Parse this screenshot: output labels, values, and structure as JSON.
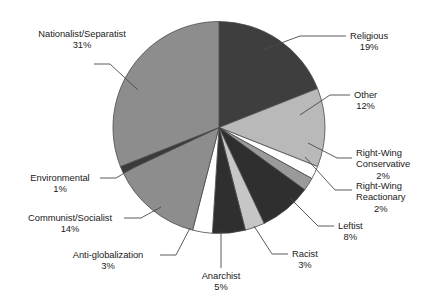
{
  "chart_data": {
    "type": "pie",
    "title": "",
    "subtitle": "",
    "xlabel": "",
    "ylabel": "",
    "legend_position": "none",
    "grid": false,
    "labels_show_percent": true,
    "start_angle_deg": 0,
    "direction": "clockwise",
    "categories": [
      "Religious",
      "Other",
      "Right-Wing Conservative",
      "Right-Wing Reactionary",
      "Leftist",
      "Racist",
      "Anarchist",
      "Anti-globalization",
      "Communist/Socialist",
      "Environmental",
      "Nationalist/Separatist"
    ],
    "values": [
      19,
      12,
      2,
      2,
      8,
      3,
      5,
      3,
      14,
      1,
      31
    ],
    "value_labels": [
      "19%",
      "12%",
      "2%",
      "2%",
      "8%",
      "3%",
      "5%",
      "3%",
      "14%",
      "1%",
      "31%"
    ],
    "colors": [
      "#3e3e3e",
      "#b9b9b9",
      "#ffffff",
      "#9a9a9a",
      "#2f2f2f",
      "#c6c6c6",
      "#2f2f2f",
      "#ffffff",
      "#8d8d8d",
      "#3a3a3a",
      "#8d8d8d"
    ],
    "slice_outline_color": "#4a4a4a",
    "leader_line_color": "#4a4a4a",
    "slices": [
      {
        "name": "Religious",
        "value": 19,
        "label": "Religious",
        "pct": "19%"
      },
      {
        "name": "Other",
        "value": 12,
        "label": "Other",
        "pct": "12%"
      },
      {
        "name": "Right-Wing Conservative",
        "value": 2,
        "label": "Right-Wing Conservative",
        "pct": "2%"
      },
      {
        "name": "Right-Wing Reactionary",
        "value": 2,
        "label": "Right-Wing Reactionary",
        "pct": "2%"
      },
      {
        "name": "Leftist",
        "value": 8,
        "label": "Leftist",
        "pct": "8%"
      },
      {
        "name": "Racist",
        "value": 3,
        "label": "Racist",
        "pct": "3%"
      },
      {
        "name": "Anarchist",
        "value": 5,
        "label": "Anarchist",
        "pct": "5%"
      },
      {
        "name": "Anti-globalization",
        "value": 3,
        "label": "Anti-globalization",
        "pct": "3%"
      },
      {
        "name": "Communist/Socialist",
        "value": 14,
        "label": "Communist/Socialist",
        "pct": "14%"
      },
      {
        "name": "Environmental",
        "value": 1,
        "label": "Environmental",
        "pct": "1%"
      },
      {
        "name": "Nationalist/Separatist",
        "value": 31,
        "label": "Nationalist/Separatist",
        "pct": "31%"
      }
    ]
  },
  "labels": {
    "religious": {
      "name": "Religious",
      "pct": "19%"
    },
    "other": {
      "name": "Other",
      "pct": "12%"
    },
    "rw_conservative": {
      "name1": "Right-Wing",
      "name2": "Conservative",
      "pct": "2%"
    },
    "rw_reactionary": {
      "name1": "Right-Wing",
      "name2": "Reactionary",
      "pct": "2%"
    },
    "leftist": {
      "name": "Leftist",
      "pct": "8%"
    },
    "racist": {
      "name": "Racist",
      "pct": "3%"
    },
    "anarchist": {
      "name": "Anarchist",
      "pct": "5%"
    },
    "antiglobalization": {
      "name": "Anti-globalization",
      "pct": "3%"
    },
    "communist": {
      "name": "Communist/Socialist",
      "pct": "14%"
    },
    "environmental": {
      "name": "Environmental",
      "pct": "1%"
    },
    "nationalist": {
      "name": "Nationalist/Separatist",
      "pct": "31%"
    }
  }
}
